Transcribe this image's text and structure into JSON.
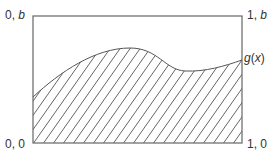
{
  "diagram": {
    "type": "area-under-curve",
    "frame": {
      "x0": 33,
      "y0": 16,
      "x1": 242,
      "y1": 143
    },
    "corner_labels": {
      "top_left": {
        "pre": "0, ",
        "var": "b"
      },
      "top_right": {
        "pre": "1, ",
        "var": "b"
      },
      "bottom_left": "0, 0",
      "bottom_right": "1, 0"
    },
    "curve_label": {
      "fn": "g",
      "open": "(",
      "var": "x",
      "close": ")"
    },
    "curve_path": "M33,97 C60,72 95,48 130,48 C158,48 165,70 185,71 C205,72 225,66 242,60",
    "hatch": {
      "spacing": 10,
      "slope_dx": 16,
      "color": "#555555"
    },
    "colors": {
      "frame": "#666666",
      "curve": "#555555",
      "text": "#333333",
      "background": "#ffffff"
    }
  }
}
